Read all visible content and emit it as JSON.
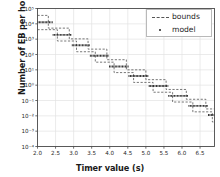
{
  "chart_data": {
    "type": "line",
    "title": "",
    "xlabel": "Timer value (s)",
    "ylabel": "Number of EB per hour",
    "xlim": [
      2.0,
      6.9
    ],
    "ylim_log10": [
      -4,
      5
    ],
    "yscale": "log",
    "grid": true,
    "legend_position": "upper right",
    "xticks": [
      2.0,
      2.5,
      3.0,
      3.5,
      4.0,
      4.5,
      5.0,
      5.5,
      6.0,
      6.5
    ],
    "xticklabels": [
      "2.0",
      "2.5",
      "3.0",
      "3.5",
      "4.0",
      "4.5",
      "5.0",
      "5.5",
      "6.0",
      "6.5"
    ],
    "yticks_log10": [
      5,
      4,
      3,
      2,
      1,
      0,
      -1,
      -2,
      -3,
      -4
    ],
    "yticklabels": [
      "10⁵",
      "10⁴",
      "10³",
      "10²",
      "10¹",
      "10⁰",
      "10⁻¹",
      "10⁻²",
      "10⁻³",
      "10⁻⁴"
    ],
    "series": [
      {
        "name": "model",
        "style": "dotted-thick",
        "color": "#222222",
        "steps": [
          {
            "x0": 2.0,
            "x1": 2.42,
            "y_log10": 4.1
          },
          {
            "x0": 2.42,
            "x1": 2.95,
            "y_log10": 3.28
          },
          {
            "x0": 2.95,
            "x1": 3.45,
            "y_log10": 2.6
          },
          {
            "x0": 3.45,
            "x1": 3.98,
            "y_log10": 1.92
          },
          {
            "x0": 3.98,
            "x1": 4.52,
            "y_log10": 1.22
          },
          {
            "x0": 4.52,
            "x1": 5.08,
            "y_log10": 0.6
          },
          {
            "x0": 5.08,
            "x1": 5.62,
            "y_log10": -0.05
          },
          {
            "x0": 5.62,
            "x1": 6.18,
            "y_log10": -0.7
          },
          {
            "x0": 6.18,
            "x1": 6.72,
            "y_log10": -1.35
          },
          {
            "x0": 6.72,
            "x1": 6.9,
            "y_log10": -1.95
          }
        ]
      },
      {
        "name": "bounds",
        "style": "dashed",
        "color": "#555555",
        "upper_steps": [
          {
            "x0": 2.0,
            "x1": 2.3,
            "y_log10": 4.55
          },
          {
            "x0": 2.3,
            "x1": 2.88,
            "y_log10": 3.72
          },
          {
            "x0": 2.88,
            "x1": 3.4,
            "y_log10": 3.02
          },
          {
            "x0": 3.4,
            "x1": 3.92,
            "y_log10": 2.35
          },
          {
            "x0": 3.92,
            "x1": 4.46,
            "y_log10": 1.66
          },
          {
            "x0": 4.46,
            "x1": 5.0,
            "y_log10": 1.0
          },
          {
            "x0": 5.0,
            "x1": 5.56,
            "y_log10": 0.36
          },
          {
            "x0": 5.56,
            "x1": 6.12,
            "y_log10": -0.28
          },
          {
            "x0": 6.12,
            "x1": 6.66,
            "y_log10": -0.92
          },
          {
            "x0": 6.66,
            "x1": 6.9,
            "y_log10": -1.55
          }
        ],
        "lower_steps": [
          {
            "x0": 2.0,
            "x1": 2.55,
            "y_log10": 3.62
          },
          {
            "x0": 2.55,
            "x1": 3.08,
            "y_log10": 2.88
          },
          {
            "x0": 3.08,
            "x1": 3.6,
            "y_log10": 2.18
          },
          {
            "x0": 3.6,
            "x1": 4.12,
            "y_log10": 1.5
          },
          {
            "x0": 4.12,
            "x1": 4.66,
            "y_log10": 0.82
          },
          {
            "x0": 4.66,
            "x1": 5.2,
            "y_log10": 0.18
          },
          {
            "x0": 5.2,
            "x1": 5.74,
            "y_log10": -0.46
          },
          {
            "x0": 5.74,
            "x1": 6.3,
            "y_log10": -1.1
          },
          {
            "x0": 6.3,
            "x1": 6.84,
            "y_log10": -1.74
          },
          {
            "x0": 6.84,
            "x1": 6.9,
            "y_log10": -2.4
          }
        ]
      }
    ],
    "legend": [
      {
        "label": "bounds",
        "marker": "dashed-line"
      },
      {
        "label": "model",
        "marker": "dot"
      }
    ]
  }
}
